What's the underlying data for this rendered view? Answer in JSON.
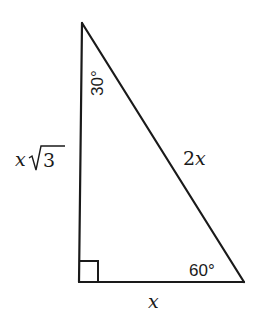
{
  "diagram": {
    "type": "right-triangle-30-60-90",
    "colors": {
      "stroke": "#1a1a1a",
      "background": "#ffffff"
    },
    "vertices": {
      "top": {
        "x": 82,
        "y": 23
      },
      "bottom_left": {
        "x": 79,
        "y": 282
      },
      "bottom_right": {
        "x": 244,
        "y": 282
      }
    },
    "labels": {
      "left_side_var": "x",
      "left_side_radicand": "3",
      "hypotenuse_num": "2",
      "hypotenuse_var": "x",
      "bottom_side": "x",
      "top_angle": "30°",
      "bottom_right_angle": "60°"
    },
    "right_angle_marker": true
  }
}
